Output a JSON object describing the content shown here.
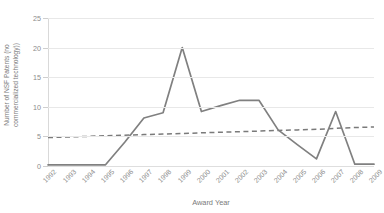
{
  "chart_data": {
    "type": "line",
    "title": "",
    "xlabel": "Award Year",
    "ylabel": "Number of NSF Patents (no commercialized technology)",
    "ylabel_line1": "Number of NSF Patents (no",
    "ylabel_line2": "commercialized technology))",
    "categories": [
      "1992",
      "1993",
      "1994",
      "1995",
      "1996",
      "1997",
      "1998",
      "1999",
      "2000",
      "2001",
      "2002",
      "2003",
      "2004",
      "2005",
      "2006",
      "2007",
      "2008",
      "2009"
    ],
    "x": [
      1992,
      1993,
      1994,
      1995,
      1996,
      1997,
      1998,
      1999,
      2000,
      2001,
      2002,
      2003,
      2004,
      2005,
      2006,
      2007,
      2008,
      2009
    ],
    "series": [
      {
        "name": "Number of NSF Patents",
        "style": "solid",
        "color": "#808080",
        "values": [
          0.2,
          0.2,
          0.2,
          0.2,
          4.0,
          8.1,
          9.0,
          20.0,
          9.2,
          10.2,
          11.1,
          11.1,
          6.1,
          3.6,
          1.2,
          9.2,
          0.3,
          0.3
        ]
      },
      {
        "name": "Linear trendline",
        "style": "dashed",
        "color": "#7a7a7a",
        "values": [
          4.8,
          4.9,
          5.0,
          5.1,
          5.2,
          5.3,
          5.4,
          5.5,
          5.6,
          5.7,
          5.8,
          5.9,
          6.0,
          6.1,
          6.2,
          6.35,
          6.5,
          6.6
        ]
      }
    ],
    "y_ticks": [
      0,
      5,
      10,
      15,
      20,
      25
    ],
    "ylim": [
      0,
      25
    ],
    "grid": true,
    "legend": "none",
    "gridline_color": "#e8e8e8",
    "axis_text_color": "#8c8c8c"
  }
}
